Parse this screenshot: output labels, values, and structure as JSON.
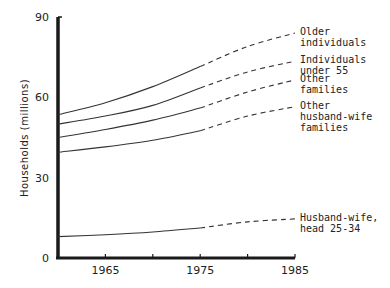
{
  "chart_data": {
    "type": "line",
    "title": "",
    "xlabel": "",
    "ylabel": "Households (millions)",
    "xlim": [
      1960,
      1985
    ],
    "ylim": [
      0,
      90
    ],
    "x_ticks": [
      1965,
      1970,
      1975,
      1980,
      1985
    ],
    "x_tick_labels": [
      "1965",
      "1975",
      "1985"
    ],
    "y_ticks": [
      0,
      30,
      60,
      90
    ],
    "y_tick_labels": [
      "0",
      "30",
      "60",
      "90"
    ],
    "grid": false,
    "legend": "inline labels at right end of lines",
    "note": "Solid lines are actual data (1960-1975); dashed lines are projections (1975-1985)",
    "x": [
      1960,
      1965,
      1970,
      1975,
      1980,
      1985
    ],
    "series": [
      {
        "name": "Older individuals",
        "label_lines": [
          "Older",
          "individuals"
        ],
        "values": [
          53.5,
          58,
          64,
          71.5,
          79,
          84
        ],
        "projected_from": 1975
      },
      {
        "name": "Individuals under 55",
        "label_lines": [
          "Individuals",
          "under 55"
        ],
        "values": [
          50,
          53,
          57,
          63.5,
          69.5,
          73.5
        ],
        "projected_from": 1975
      },
      {
        "name": "Other families",
        "label_lines": [
          "Other",
          "families"
        ],
        "values": [
          45,
          48,
          51.5,
          56,
          62,
          66.5
        ],
        "projected_from": 1975
      },
      {
        "name": "Other husband-wife families",
        "label_lines": [
          "Other",
          "husband-wife",
          "families"
        ],
        "values": [
          39.5,
          41.5,
          44,
          47.5,
          53,
          56.5
        ],
        "projected_from": 1975
      },
      {
        "name": "Husband-wife, head 25-34",
        "label_lines": [
          "Husband-wife,",
          "head 25-34"
        ],
        "values": [
          8,
          8.7,
          9.7,
          11.2,
          13.5,
          14.6
        ],
        "projected_from": 1975
      }
    ]
  }
}
